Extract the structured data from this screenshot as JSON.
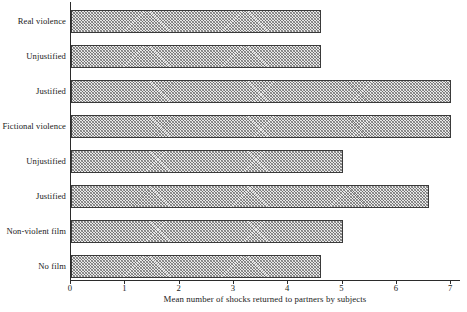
{
  "chart_data": {
    "type": "bar",
    "orientation": "horizontal",
    "title": "",
    "xlabel": "Mean number of shocks returned to partners by subjects",
    "ylabel": "",
    "xlim": [
      0,
      7
    ],
    "xticks": [
      0,
      1,
      2,
      3,
      4,
      5,
      6,
      7
    ],
    "xtick_labels": [
      "0",
      "1",
      "2",
      "3",
      "4",
      "5",
      "6",
      "7"
    ],
    "grid": false,
    "legend": null,
    "categories": [
      "Real violence",
      "Unjustified",
      "Justified",
      "Fictional violence",
      "Unjustified",
      "Justified",
      "Non-violent film",
      "No film"
    ],
    "values": [
      4.6,
      4.6,
      7.0,
      7.0,
      5.0,
      6.6,
      5.0,
      4.6
    ],
    "bar_style": {
      "fill": "#e9e9e9",
      "hatch": "crosshatch",
      "edge": "#3a3a3a"
    }
  }
}
